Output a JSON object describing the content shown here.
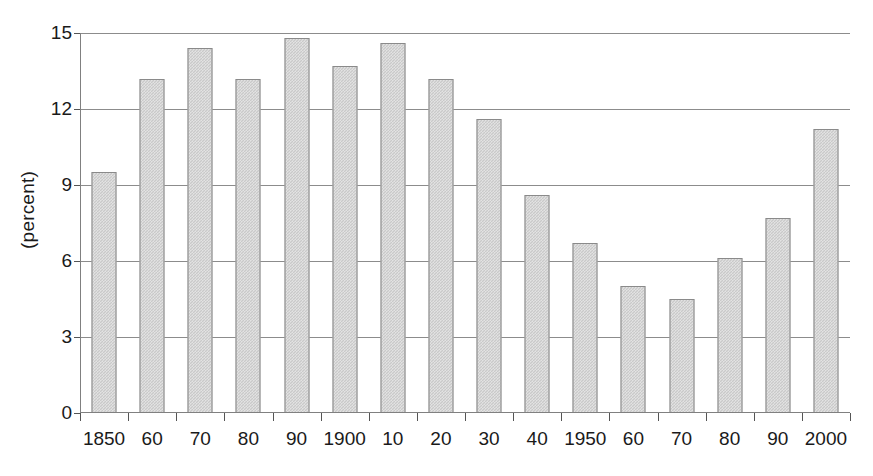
{
  "chart_data": {
    "type": "bar",
    "title": "",
    "subtitle": "",
    "xlabel": "",
    "ylabel": "(percent)",
    "categories": [
      "1850",
      "60",
      "70",
      "80",
      "90",
      "1900",
      "10",
      "20",
      "30",
      "40",
      "1950",
      "60",
      "70",
      "80",
      "90",
      "2000"
    ],
    "values": [
      9.5,
      13.2,
      14.4,
      13.2,
      14.8,
      13.7,
      14.6,
      13.2,
      11.6,
      8.6,
      6.7,
      5.0,
      4.5,
      6.1,
      7.7,
      11.2
    ],
    "ylim": [
      0,
      15
    ],
    "yticks": [
      0,
      3,
      6,
      9,
      12,
      15
    ],
    "ytick_labels": [
      "0",
      "3",
      "6",
      "9",
      "12",
      "15"
    ],
    "grid": "horizontal",
    "legend": "none",
    "bar_color": "#c9c9c9",
    "bar_border_color": "#8a8a8a",
    "gridline_color": "#8c8c8c",
    "axis_color": "#808080",
    "text_color": "#1a1a1a",
    "background": "#ffffff"
  }
}
